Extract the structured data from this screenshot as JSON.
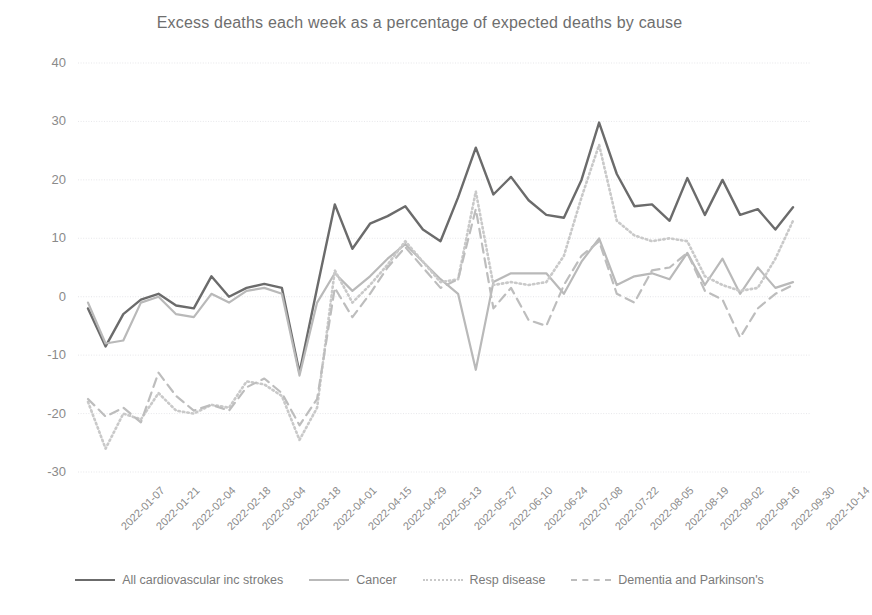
{
  "chart": {
    "title": "Excess deaths each week as a percentage of expected deaths by cause",
    "type": "line"
  },
  "axis": {
    "y_ticks": [
      "40",
      "30",
      "20",
      "10",
      "0",
      "-10",
      "-20",
      "-30"
    ],
    "x_ticks": [
      "2022-01-07",
      "2022-01-21",
      "2022-02-04",
      "2022-02-18",
      "2022-03-04",
      "2022-03-18",
      "2022-04-01",
      "2022-04-15",
      "2022-04-29",
      "2022-05-13",
      "2022-05-27",
      "2022-06-10",
      "2022-06-24",
      "2022-07-08",
      "2022-07-22",
      "2022-08-05",
      "2022-08-19",
      "2022-09-02",
      "2022-09-16",
      "2022-09-30",
      "2022-10-14"
    ]
  },
  "legend": {
    "items": [
      {
        "label": "All cardiovascular inc strokes",
        "style": "solid-dark",
        "color": "#6b6b6b"
      },
      {
        "label": "Cancer",
        "style": "solid-light",
        "color": "#b9b9b9"
      },
      {
        "label": "Resp disease",
        "style": "dotted",
        "color": "#c9c9c9"
      },
      {
        "label": "Dementia and Parkinson's",
        "style": "dashed",
        "color": "#bdbdbd"
      }
    ]
  },
  "chart_data": {
    "type": "line",
    "title": "Excess deaths each week as a percentage of expected deaths by cause",
    "xlabel": "",
    "ylabel": "",
    "ylim": [
      -30,
      40
    ],
    "grid": true,
    "legend_position": "bottom",
    "x": [
      "2022-01-07",
      "2022-01-14",
      "2022-01-21",
      "2022-01-28",
      "2022-02-04",
      "2022-02-11",
      "2022-02-18",
      "2022-02-25",
      "2022-03-04",
      "2022-03-11",
      "2022-03-18",
      "2022-03-25",
      "2022-04-01",
      "2022-04-08",
      "2022-04-15",
      "2022-04-22",
      "2022-04-29",
      "2022-05-06",
      "2022-05-13",
      "2022-05-20",
      "2022-05-27",
      "2022-06-03",
      "2022-06-10",
      "2022-06-17",
      "2022-06-24",
      "2022-07-01",
      "2022-07-08",
      "2022-07-15",
      "2022-07-22",
      "2022-07-29",
      "2022-08-05",
      "2022-08-12",
      "2022-08-19",
      "2022-08-26",
      "2022-09-02",
      "2022-09-09",
      "2022-09-16",
      "2022-09-23",
      "2022-09-30",
      "2022-10-07",
      "2022-10-14"
    ],
    "series": [
      {
        "name": "All cardiovascular inc strokes",
        "color": "#6b6b6b",
        "style": "solid",
        "width": 2.4,
        "values": [
          -2.0,
          -8.5,
          -3.0,
          -0.5,
          0.5,
          -1.5,
          -2.0,
          3.5,
          0.0,
          1.5,
          2.2,
          1.5,
          -13.0,
          1.5,
          15.8,
          8.2,
          12.5,
          13.8,
          15.5,
          11.5,
          9.5,
          17.0,
          25.5,
          17.5,
          20.5,
          16.5,
          14.0,
          13.5,
          20.0,
          29.8,
          21.0,
          15.5,
          15.8,
          13.0,
          20.3,
          14.0,
          20.0,
          14.0,
          15.0,
          11.5,
          15.3
        ]
      },
      {
        "name": "Cancer",
        "color": "#b9b9b9",
        "style": "solid",
        "width": 2.2,
        "values": [
          -1.0,
          -8.0,
          -7.5,
          -1.0,
          0.0,
          -3.0,
          -3.5,
          0.5,
          -1.0,
          1.0,
          1.5,
          0.5,
          -13.5,
          -1.0,
          4.0,
          1.0,
          3.5,
          6.5,
          9.0,
          6.0,
          3.0,
          0.5,
          -12.5,
          2.5,
          4.0,
          4.0,
          4.0,
          0.5,
          6.0,
          10.0,
          2.0,
          3.5,
          4.0,
          3.0,
          7.5,
          2.0,
          6.5,
          0.5,
          5.0,
          1.5,
          2.5
        ]
      },
      {
        "name": "Resp disease",
        "color": "#c9c9c9",
        "style": "dotted",
        "width": 2.6,
        "values": [
          -18.0,
          -26.0,
          -20.0,
          -21.0,
          -16.5,
          -19.5,
          -20.0,
          -18.5,
          -19.0,
          -14.5,
          -15.0,
          -17.0,
          -24.5,
          -19.0,
          4.5,
          -1.0,
          2.0,
          5.5,
          9.5,
          6.0,
          2.5,
          3.0,
          18.0,
          2.0,
          2.5,
          2.0,
          2.5,
          7.0,
          17.0,
          26.0,
          13.0,
          10.5,
          9.5,
          10.0,
          9.5,
          3.5,
          2.0,
          1.0,
          1.5,
          6.5,
          13.0
        ]
      },
      {
        "name": "Dementia and Parkinson's",
        "color": "#bdbdbd",
        "style": "dashed",
        "width": 2.2,
        "values": [
          -17.5,
          -20.5,
          -19.0,
          -21.5,
          -13.0,
          -17.0,
          -19.5,
          -18.5,
          -19.5,
          -15.5,
          -14.0,
          -16.5,
          -22.0,
          -17.5,
          1.5,
          -3.5,
          0.5,
          5.0,
          8.5,
          5.0,
          1.5,
          3.0,
          15.0,
          -2.0,
          1.5,
          -4.0,
          -5.0,
          2.0,
          7.0,
          9.5,
          0.5,
          -1.0,
          4.5,
          5.0,
          7.5,
          1.0,
          -0.5,
          -7.0,
          -2.0,
          0.5,
          2.0
        ]
      }
    ]
  }
}
